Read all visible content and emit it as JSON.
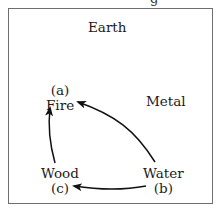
{
  "figure": {
    "top_cut_text": "g",
    "elements": {
      "earth": {
        "name": "Earth"
      },
      "metal": {
        "name": "Metal"
      },
      "fire": {
        "name": "Fire",
        "tag": "(a)"
      },
      "water": {
        "name": "Water",
        "tag": "(b)"
      },
      "wood": {
        "name": "Wood",
        "tag": "(c)"
      }
    },
    "arrows": [
      {
        "from": "water",
        "to": "fire"
      },
      {
        "from": "wood",
        "to": "fire"
      },
      {
        "from": "water",
        "to": "wood"
      }
    ]
  }
}
